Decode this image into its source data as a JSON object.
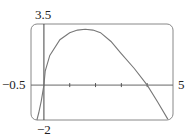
{
  "chart_data": {
    "type": "line",
    "title": "",
    "xlabel": "",
    "ylabel": "",
    "xlim": [
      -0.5,
      5
    ],
    "ylim": [
      -2,
      3.5
    ],
    "grid": false,
    "x_tick_marks": [
      1,
      2,
      3,
      4
    ],
    "labels": {
      "x_min": "−0.5",
      "x_max": "5",
      "y_max": "3.5",
      "y_min": "−2"
    },
    "series": [
      {
        "name": "curve",
        "points": [
          [
            -0.27,
            -2.0
          ],
          [
            -0.2,
            -1.6
          ],
          [
            -0.1,
            -0.9
          ],
          [
            0,
            0
          ],
          [
            0.05,
            0.8
          ],
          [
            0.23,
            1.7
          ],
          [
            0.62,
            2.6
          ],
          [
            1.0,
            3.0
          ],
          [
            1.3,
            3.15
          ],
          [
            1.6,
            3.2
          ],
          [
            1.9,
            3.15
          ],
          [
            2.19,
            3.0
          ],
          [
            2.6,
            2.5
          ],
          [
            2.97,
            1.85
          ],
          [
            3.5,
            0.95
          ],
          [
            4.0,
            0
          ],
          [
            4.4,
            -0.95
          ],
          [
            4.8,
            -1.95
          ]
        ]
      }
    ]
  }
}
